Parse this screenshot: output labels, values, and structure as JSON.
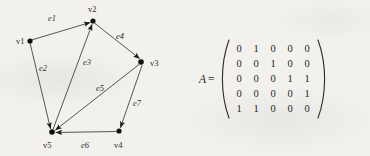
{
  "figure": {
    "graph": {
      "vertices": [
        {
          "id": "v1",
          "label": "v1",
          "x": 30,
          "y": 41,
          "label_x": 16,
          "label_y": 36
        },
        {
          "id": "v2",
          "label": "v2",
          "x": 93,
          "y": 21,
          "label_x": 88,
          "label_y": 4
        },
        {
          "id": "v3",
          "label": "v3",
          "x": 141,
          "y": 62,
          "label_x": 150,
          "label_y": 58
        },
        {
          "id": "v4",
          "label": "v4",
          "x": 119,
          "y": 131,
          "label_x": 114,
          "label_y": 140
        },
        {
          "id": "v5",
          "label": "v5",
          "x": 52,
          "y": 132,
          "label_x": 43,
          "label_y": 140
        }
      ],
      "edges": [
        {
          "id": "e1",
          "label": "e1",
          "from": "v1",
          "to": "v2",
          "label_x": 48,
          "label_y": 13
        },
        {
          "id": "e2",
          "label": "e2",
          "from": "v1",
          "to": "v5",
          "label_x": 39,
          "label_y": 63
        },
        {
          "id": "e3",
          "label": "e3",
          "from": "v5",
          "to": "v2",
          "label_x": 83,
          "label_y": 57
        },
        {
          "id": "e4",
          "label": "e4",
          "from": "v2",
          "to": "v3",
          "label_x": 116,
          "label_y": 31
        },
        {
          "id": "e5",
          "label": "e5",
          "from": "v3",
          "to": "v5",
          "label_x": 96,
          "label_y": 83
        },
        {
          "id": "e6",
          "label": "e6",
          "from": "v4",
          "to": "v5",
          "label_x": 81,
          "label_y": 140
        },
        {
          "id": "e7",
          "label": "e7",
          "from": "v3",
          "to": "v4",
          "label_x": 133,
          "label_y": 98
        }
      ],
      "ink_color": "#3a3a3a",
      "vertex_color": "#111111"
    },
    "matrix": {
      "name": "A",
      "equals": "=",
      "rows": [
        [
          "0",
          "1",
          "0",
          "0",
          "0"
        ],
        [
          "0",
          "0",
          "1",
          "0",
          "0"
        ],
        [
          "0",
          "0",
          "0",
          "1",
          "1"
        ],
        [
          "0",
          "0",
          "0",
          "0",
          "1"
        ],
        [
          "1",
          "1",
          "0",
          "0",
          "0"
        ]
      ]
    }
  },
  "page": {
    "background_color": "#f2f1ee"
  }
}
